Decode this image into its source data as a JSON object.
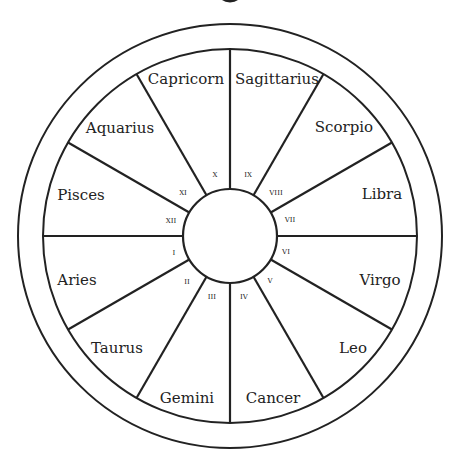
{
  "diagram": {
    "type": "astrological-wheel",
    "signs": [
      {
        "name": "Capricorn",
        "house": "X"
      },
      {
        "name": "Sagittarius",
        "house": "IX"
      },
      {
        "name": "Scorpio",
        "house": "VIII"
      },
      {
        "name": "Libra",
        "house": "VII"
      },
      {
        "name": "Virgo",
        "house": "VI"
      },
      {
        "name": "Leo",
        "house": "V"
      },
      {
        "name": "Cancer",
        "house": "IV"
      },
      {
        "name": "Gemini",
        "house": "III"
      },
      {
        "name": "Taurus",
        "house": "II"
      },
      {
        "name": "Aries",
        "house": "I"
      },
      {
        "name": "Pisces",
        "house": "XII"
      },
      {
        "name": "Aquarius",
        "house": "XI"
      }
    ]
  }
}
